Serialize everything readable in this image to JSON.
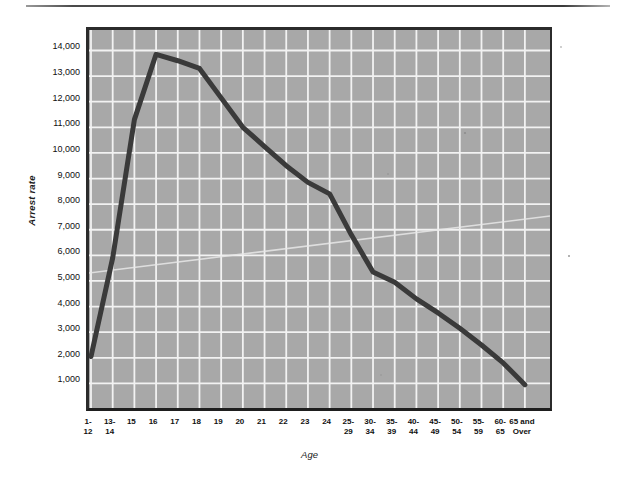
{
  "figure": {
    "top_rule": "horizontal-rule",
    "background_color": "#ffffff",
    "plot_fill_color": "#a8a8a8",
    "gridline_color": "#f2f2f2",
    "series_color": "#3a3a3a",
    "frame_color": "#2b2b2b"
  },
  "chart_data": {
    "type": "line",
    "title": "",
    "xlabel": "Age",
    "ylabel": "Arrest rate",
    "grid": true,
    "legend": "none",
    "ylim": [
      0,
      14800
    ],
    "ytick_labels": [
      "14,000",
      "13,000",
      "12,000",
      "11,000",
      "10,000",
      "9,000",
      "8,000",
      "7,000",
      "6,000",
      "5,000",
      "4,000",
      "3,000",
      "2,000",
      "1,000"
    ],
    "ytick_values": [
      14000,
      13000,
      12000,
      11000,
      10000,
      9000,
      8000,
      7000,
      6000,
      5000,
      4000,
      3000,
      2000,
      1000
    ],
    "categories": [
      "1-12",
      "13-14",
      "15",
      "16",
      "17",
      "18",
      "19",
      "20",
      "21",
      "22",
      "23",
      "24",
      "25-29",
      "30-34",
      "35-39",
      "40-44",
      "45-49",
      "50-54",
      "55-59",
      "60-65",
      "65 and Over"
    ],
    "series": [
      {
        "name": "Arrest rate",
        "values": [
          2050,
          5900,
          11300,
          13850,
          13600,
          13300,
          12150,
          11000,
          10250,
          9500,
          8850,
          8400,
          6800,
          5350,
          4950,
          4300,
          3750,
          3150,
          2500,
          1800,
          950
        ]
      }
    ]
  },
  "x_tick_lines": [
    [
      "1-",
      "12"
    ],
    [
      "13-",
      "14"
    ],
    [
      "15"
    ],
    [
      "16"
    ],
    [
      "17"
    ],
    [
      "18"
    ],
    [
      "19"
    ],
    [
      "20"
    ],
    [
      "21"
    ],
    [
      "22"
    ],
    [
      "23"
    ],
    [
      "24"
    ],
    [
      "25-",
      "29"
    ],
    [
      "30-",
      "34"
    ],
    [
      "35-",
      "39"
    ],
    [
      "40-",
      "44"
    ],
    [
      "45-",
      "49"
    ],
    [
      "50-",
      "54"
    ],
    [
      "55-",
      "59"
    ],
    [
      "60-",
      "65"
    ],
    [
      "65 and",
      "Over"
    ]
  ]
}
